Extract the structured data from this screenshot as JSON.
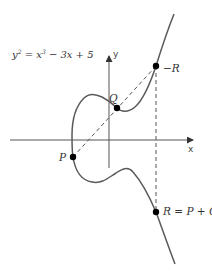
{
  "diagram": {
    "equation": {
      "lhs_base": "y",
      "lhs_exp": "2",
      "eq": " = ",
      "x_base": "x",
      "x_exp": "3",
      "rest": " − 3x + 5"
    },
    "axes": {
      "x_label": "x",
      "y_label": "y"
    },
    "points": {
      "P": {
        "label": "P"
      },
      "Q": {
        "label": "Q"
      },
      "neg_R": {
        "label": "−R"
      },
      "R": {
        "label": "R = P + Q"
      }
    },
    "colors": {
      "curve": "#5a5a5a",
      "axis": "#444444",
      "dashed": "#555555",
      "point": "#000000",
      "text": "#333333"
    }
  }
}
